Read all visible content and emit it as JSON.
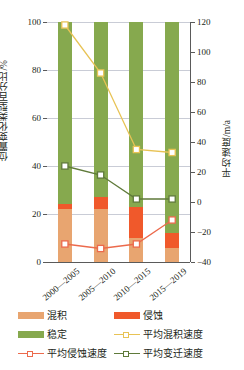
{
  "chart_data": {
    "type": "bar",
    "title": "",
    "categories": [
      "2000—2005",
      "2005—2010",
      "2010—2015",
      "2015—2019"
    ],
    "ylabel": "位置变化类型百分比/%",
    "ylabel_right": "平均速度/m/a",
    "xlabel": "",
    "ylim": [
      0,
      100
    ],
    "ylim_right": [
      -40,
      120
    ],
    "yticks": [
      0,
      20,
      40,
      60,
      80,
      100
    ],
    "yticks_right": [
      -40,
      -20,
      0,
      20,
      40,
      60,
      80,
      100,
      120
    ],
    "grid": true,
    "legend_position": "below",
    "stacked": true,
    "series": [
      {
        "name": "混积",
        "label": "混积",
        "kind": "bar",
        "color": "#e8a570",
        "values": [
          22,
          22,
          10,
          6
        ]
      },
      {
        "name": "侵蚀",
        "label": "侵蚀",
        "kind": "bar",
        "color": "#f0592b",
        "values": [
          2,
          5,
          13,
          6
        ]
      },
      {
        "name": "稳定",
        "label": "稳定",
        "kind": "bar",
        "color": "#86a94e",
        "values": [
          76,
          73,
          77,
          88
        ]
      },
      {
        "name": "平均混积速度",
        "label": "平均混积速度",
        "kind": "line",
        "axis": "right",
        "color": "#e8c355",
        "values": [
          118,
          86,
          35,
          33
        ]
      },
      {
        "name": "平均侵蚀速度",
        "label": "平均侵蚀速度",
        "kind": "line",
        "axis": "right",
        "color": "#ec6a4c",
        "values": [
          -28,
          -31,
          -28,
          -12
        ]
      },
      {
        "name": "平均变迁速度",
        "label": "平均变迁速度",
        "kind": "line",
        "axis": "right",
        "color": "#5f7a3a",
        "values": [
          24,
          18,
          2,
          2
        ]
      }
    ]
  },
  "axes": {
    "left_ticks": [
      "100",
      "80",
      "60",
      "40",
      "20",
      "0"
    ],
    "right_ticks": [
      "120",
      "100",
      "80",
      "60",
      "40",
      "20",
      "0",
      "−20",
      "−40"
    ],
    "left_title": "位置变化类型百分比/%",
    "right_title": "平均速度/m/a",
    "x_labels": [
      "2000—2005",
      "2005—2010",
      "2010—2015",
      "2015—2019"
    ]
  },
  "legend": {
    "items": [
      {
        "label": "混积",
        "color": "#e8a570",
        "kind": "bar"
      },
      {
        "label": "侵蚀",
        "color": "#f0592b",
        "kind": "bar"
      },
      {
        "label": "稳定",
        "color": "#86a94e",
        "kind": "bar"
      },
      {
        "label": "平均混积速度",
        "color": "#e8c355",
        "kind": "line"
      },
      {
        "label": "平均侵蚀速度",
        "color": "#ec6a4c",
        "kind": "line"
      },
      {
        "label": "平均变迁速度",
        "color": "#5f7a3a",
        "kind": "line"
      }
    ]
  }
}
